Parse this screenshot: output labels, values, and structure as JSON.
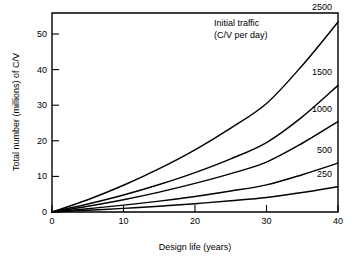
{
  "chart_data": {
    "type": "line",
    "title": "",
    "xlabel": "Design life (years)",
    "ylabel": "Total number (millions) of C/V",
    "xlim": [
      0,
      40
    ],
    "ylim": [
      0,
      55
    ],
    "xticks": [
      0,
      10,
      20,
      30,
      40
    ],
    "yticks": [
      0,
      10,
      20,
      30,
      40,
      50
    ],
    "xtick_labels": [
      "0",
      "10",
      "20",
      "30",
      "40"
    ],
    "ytick_labels": [
      "0",
      "10",
      "20",
      "30",
      "40",
      "50"
    ],
    "grid": false,
    "legend_position": "inline-right-of-curve",
    "legend_title_line1": "Initial traffic",
    "legend_title_line2": "(C/V per day)",
    "x": [
      0,
      5,
      10,
      15,
      20,
      25,
      30,
      35,
      40
    ],
    "series": [
      {
        "name": "2500",
        "label": "2500",
        "values": [
          0,
          3.4,
          7.4,
          12.0,
          17.2,
          23.2,
          30.0,
          40.5,
          52.5
        ]
      },
      {
        "name": "1500",
        "label": "1500",
        "values": [
          0,
          2.2,
          4.7,
          7.6,
          10.9,
          14.7,
          19.2,
          26.3,
          35.0
        ]
      },
      {
        "name": "1000",
        "label": "1000",
        "values": [
          0,
          1.6,
          3.4,
          5.5,
          7.9,
          10.6,
          13.8,
          19.0,
          25.0
        ]
      },
      {
        "name": "500",
        "label": "500",
        "values": [
          0,
          0.9,
          1.9,
          3.0,
          4.3,
          5.8,
          7.5,
          10.3,
          13.5
        ]
      },
      {
        "name": "250",
        "label": "250",
        "values": [
          0,
          0.5,
          1.0,
          1.6,
          2.3,
          3.1,
          4.0,
          5.4,
          7.0
        ]
      }
    ]
  },
  "style": {
    "line_color": "#000000",
    "axis_color": "#000000",
    "background": "#ffffff"
  }
}
